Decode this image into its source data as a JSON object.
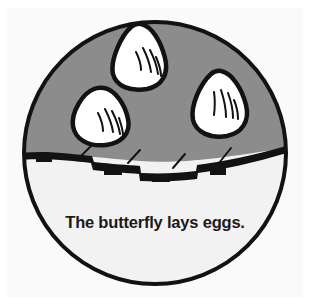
{
  "illustration": {
    "title": "Butterfly life cycle stage illustration",
    "caption": "The butterfly lays eggs.",
    "colors": {
      "page_background": "#ffffff",
      "panel_background": "#fafafa",
      "outline": "#121212",
      "leaf_top_fill": "#8c8c8c",
      "leaf_bottom_fill": "#f2f2f2",
      "egg_fill": "#ffffff",
      "caption_color": "#1a1a1a"
    },
    "circle": {
      "center_x": 155,
      "center_y": 153,
      "radius": 132,
      "outline_width": 4
    },
    "regions": [
      {
        "name": "upper-leaf-surface",
        "fill": "#8c8c8c"
      },
      {
        "name": "lower-leaf-surface",
        "fill": "#f2f2f2"
      }
    ],
    "eggs": [
      {
        "name": "egg-top-center",
        "cx": 141,
        "cy": 60,
        "hatch_lines": 4
      },
      {
        "name": "egg-left",
        "cx": 100,
        "cy": 119,
        "hatch_lines": 4
      },
      {
        "name": "egg-right",
        "cx": 221,
        "cy": 105,
        "hatch_lines": 4
      }
    ],
    "egg_count": 3,
    "tick_marks": 4,
    "notches": 4
  }
}
